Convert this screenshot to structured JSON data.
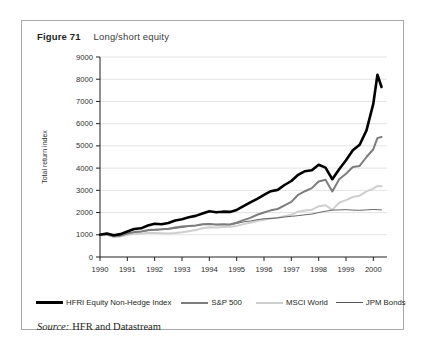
{
  "figure": {
    "number": "Figure 71",
    "title": "Long/short equity",
    "source_word": "Source:",
    "source_text": "HFR and Datastream"
  },
  "legend": {
    "items": [
      {
        "label": "HFRI Equity Non-Hedge Index",
        "color": "#000000",
        "width": 2.6
      },
      {
        "label": "S&P 500",
        "color": "#7d7d7d",
        "width": 2.0
      },
      {
        "label": "MSCI World",
        "color": "#cfcfcf",
        "width": 2.0
      },
      {
        "label": "JPM Bonds",
        "color": "#555555",
        "width": 0.9
      }
    ]
  },
  "chart_data": {
    "type": "line",
    "title": "Long/short equity",
    "xlabel": "",
    "ylabel": "Total return index",
    "xlim": [
      1990,
      2000.5
    ],
    "ylim": [
      0,
      9000
    ],
    "grid": true,
    "legend_position": "bottom",
    "xticks": [
      "1990",
      "1991",
      "1992",
      "1993",
      "1994",
      "1995",
      "1996",
      "1997",
      "1998",
      "1999",
      "2000"
    ],
    "yticks": [
      "0",
      "1000",
      "2000",
      "3000",
      "4000",
      "5000",
      "6000",
      "7000",
      "8000",
      "9000"
    ],
    "x": [
      1990.0,
      1990.25,
      1990.5,
      1990.75,
      1991.0,
      1991.25,
      1991.5,
      1991.75,
      1992.0,
      1992.25,
      1992.5,
      1992.75,
      1993.0,
      1993.25,
      1993.5,
      1993.75,
      1994.0,
      1994.25,
      1994.5,
      1994.75,
      1995.0,
      1995.25,
      1995.5,
      1995.75,
      1996.0,
      1996.25,
      1996.5,
      1996.75,
      1997.0,
      1997.25,
      1997.5,
      1997.75,
      1998.0,
      1998.25,
      1998.5,
      1998.75,
      1999.0,
      1999.25,
      1999.5,
      1999.75,
      2000.0,
      2000.15,
      2000.3
    ],
    "series": [
      {
        "name": "HFRI Equity Non-Hedge Index",
        "color": "#000000",
        "width": 2.6,
        "values": [
          1000,
          1060,
          980,
          1030,
          1150,
          1260,
          1290,
          1420,
          1500,
          1470,
          1530,
          1640,
          1700,
          1790,
          1850,
          1960,
          2060,
          2010,
          2040,
          2030,
          2120,
          2290,
          2460,
          2620,
          2800,
          2960,
          3020,
          3240,
          3420,
          3700,
          3860,
          3900,
          4150,
          4020,
          3500,
          3950,
          4350,
          4800,
          5050,
          5700,
          6900,
          8200,
          7650
        ]
      },
      {
        "name": "S&P 500",
        "color": "#7d7d7d",
        "width": 2.0,
        "values": [
          1000,
          1020,
          930,
          960,
          1060,
          1120,
          1150,
          1210,
          1230,
          1250,
          1270,
          1330,
          1370,
          1400,
          1420,
          1470,
          1490,
          1460,
          1470,
          1460,
          1540,
          1660,
          1760,
          1900,
          2000,
          2100,
          2160,
          2320,
          2480,
          2800,
          2960,
          3100,
          3400,
          3480,
          2950,
          3500,
          3750,
          4050,
          4100,
          4500,
          4850,
          5350,
          5400
        ]
      },
      {
        "name": "MSCI World",
        "color": "#cfcfcf",
        "width": 2.0,
        "values": [
          1000,
          1000,
          900,
          920,
          1000,
          1050,
          1060,
          1080,
          1080,
          1070,
          1060,
          1080,
          1110,
          1160,
          1210,
          1290,
          1340,
          1330,
          1350,
          1360,
          1400,
          1480,
          1540,
          1620,
          1680,
          1740,
          1770,
          1840,
          1900,
          2040,
          2090,
          2130,
          2280,
          2330,
          2120,
          2440,
          2560,
          2700,
          2760,
          2950,
          3080,
          3200,
          3180
        ]
      },
      {
        "name": "JPM Bonds",
        "color": "#555555",
        "width": 0.9,
        "values": [
          1000,
          1010,
          990,
          1030,
          1080,
          1110,
          1140,
          1180,
          1210,
          1230,
          1250,
          1290,
          1330,
          1380,
          1410,
          1460,
          1490,
          1450,
          1460,
          1450,
          1510,
          1580,
          1620,
          1680,
          1720,
          1730,
          1760,
          1800,
          1830,
          1860,
          1900,
          1930,
          2000,
          2060,
          2110,
          2120,
          2130,
          2110,
          2100,
          2120,
          2140,
          2130,
          2120
        ]
      }
    ]
  }
}
